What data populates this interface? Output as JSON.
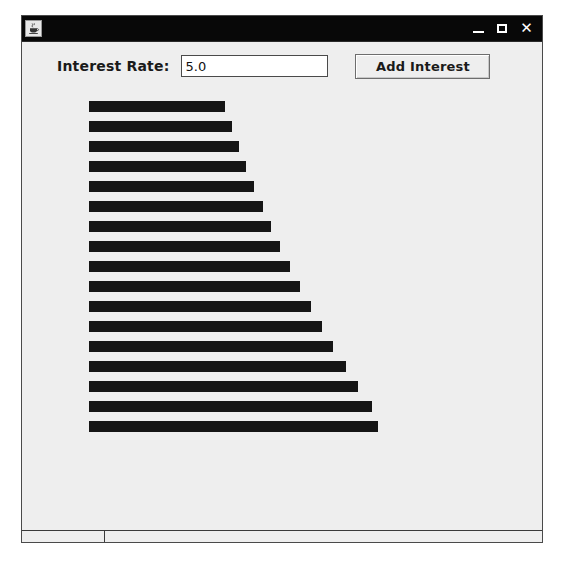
{
  "window": {
    "title": "",
    "icon": "java-coffee-cup-icon",
    "controls": {
      "minimize_label": "",
      "maximize_label": "",
      "close_label": "✕"
    }
  },
  "toolbar": {
    "rate_label": "Interest Rate:",
    "rate_value": "5.0",
    "rate_placeholder": "",
    "add_button_label": "Add Interest"
  },
  "colors": {
    "bar": "#151515",
    "panel_background": "#eeeeee",
    "title_bar": "#080808",
    "field_background": "#ffffff",
    "border": "#4a4a4a"
  },
  "chart_data": {
    "type": "bar",
    "orientation": "horizontal",
    "title": "",
    "xlabel": "",
    "ylabel": "",
    "grid": false,
    "legend": false,
    "axis_visible": false,
    "tick_labels": [],
    "interest_rate_percent": 5.0,
    "bar_count": 17,
    "categories": [
      "1",
      "2",
      "3",
      "4",
      "5",
      "6",
      "7",
      "8",
      "9",
      "10",
      "11",
      "12",
      "13",
      "14",
      "15",
      "16",
      "17"
    ],
    "values": [
      136,
      143,
      150,
      157,
      165,
      174,
      182,
      191,
      201,
      211,
      222,
      233,
      244,
      257,
      269,
      283,
      289
    ],
    "xlim": [
      0,
      300
    ],
    "bar_color": "#151515",
    "bar_thickness_px": 11,
    "bar_pitch_px": 20,
    "origin_x_px": 67,
    "origin_y_px": 11
  }
}
